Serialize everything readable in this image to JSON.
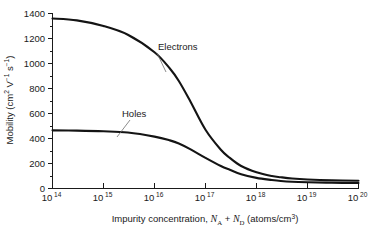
{
  "chart_data": {
    "type": "line",
    "title": "",
    "xlabel": "Impurity concentration, N_A + N_D (atoms/cm^3)",
    "xlabel_parts": {
      "lead": "Impurity concentration, ",
      "n_a_base": "N",
      "n_a_sub": "A",
      "plus": " + ",
      "n_d_base": "N",
      "n_d_sub": "D",
      "units_open": " (atoms/cm",
      "units_exp": "3",
      "units_close": ")"
    },
    "ylabel": "Mobility (cm^2 V^-1 s^-1)",
    "ylabel_parts": {
      "lead": "Mobility (cm",
      "exp_2": "2",
      "mid_v": " V",
      "exp_v": "−1",
      "mid_s": " s",
      "exp_s": "−1",
      "close": ")"
    },
    "xscale": "log",
    "yscale": "linear",
    "xlim": [
      100000000000000.0,
      1e+20
    ],
    "ylim": [
      0,
      1400
    ],
    "grid": false,
    "legend_position": "inline-annotations",
    "x_tick_labels": [
      "10¹⁴",
      "10¹⁵",
      "10¹⁶",
      "10¹⁷",
      "10¹⁸",
      "10¹⁹",
      "10²⁰"
    ],
    "x_tick_base": "10",
    "x_tick_exponents": [
      "14",
      "15",
      "16",
      "17",
      "18",
      "19",
      "20"
    ],
    "x_tick_values": [
      100000000000000.0,
      1000000000000000.0,
      1e+16,
      1e+17,
      1e+18,
      1e+19,
      1e+20
    ],
    "y_tick_labels": [
      "0",
      "200",
      "400",
      "600",
      "800",
      "1000",
      "1200",
      "1400"
    ],
    "y_tick_values": [
      0,
      200,
      400,
      600,
      800,
      1000,
      1200,
      1400
    ],
    "y_minor_tick_values": [
      100,
      300,
      500,
      700,
      900,
      1100,
      1300
    ],
    "series": [
      {
        "name": "Electrons",
        "label": "Electrons",
        "color": "#141414",
        "x": [
          100000000000000.0,
          300000000000000.0,
          1000000000000000.0,
          3000000000000000.0,
          1e+16,
          2e+16,
          3e+16,
          5e+16,
          1e+17,
          2e+17,
          3e+17,
          5e+17,
          1e+18,
          2e+18,
          3e+18,
          5e+18,
          1e+19,
          3e+19,
          1e+20
        ],
        "values": [
          1360,
          1345,
          1300,
          1230,
          1090,
          960,
          860,
          700,
          470,
          310,
          245,
          180,
          130,
          100,
          90,
          80,
          72,
          65,
          62
        ]
      },
      {
        "name": "Holes",
        "label": "Holes",
        "color": "#141414",
        "x": [
          100000000000000.0,
          300000000000000.0,
          1000000000000000.0,
          3000000000000000.0,
          1e+16,
          2e+16,
          3e+16,
          5e+16,
          1e+17,
          2e+17,
          3e+17,
          5e+17,
          1e+18,
          2e+18,
          3e+18,
          5e+18,
          1e+19,
          3e+19,
          1e+20
        ],
        "values": [
          465,
          463,
          458,
          448,
          415,
          385,
          360,
          315,
          245,
          180,
          150,
          115,
          85,
          68,
          60,
          54,
          50,
          46,
          44
        ]
      }
    ],
    "annotations": [
      {
        "text": "Electrons",
        "name": "electrons-label"
      },
      {
        "text": "Holes",
        "name": "holes-label"
      }
    ]
  }
}
